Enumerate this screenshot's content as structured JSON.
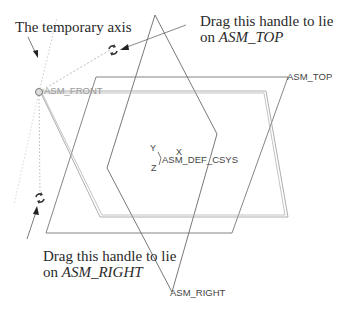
{
  "callouts": {
    "temporary_axis": "The temporary axis",
    "top_handle_line1": "Drag this handle to lie",
    "top_handle_line2_prefix": "on ",
    "top_handle_line2_ref": "ASM_TOP",
    "right_handle_line1": "Drag this handle to lie",
    "right_handle_line2_prefix": "on ",
    "right_handle_line2_ref": "ASM_RIGHT"
  },
  "planes": {
    "front": "ASM_FRONT",
    "top": "ASM_TOP",
    "right": "ASM_RIGHT"
  },
  "csys": {
    "label": "ASM_DEF_CSYS",
    "x": "X",
    "y": "Y",
    "z": "Z"
  },
  "icons": {
    "drag_handle_top": "rotate-handle-icon",
    "drag_handle_right": "rotate-handle-icon",
    "axis_origin": "circle-handle-icon"
  },
  "colors": {
    "plane_line": "#555555",
    "front_plane_line": "#8a8a8a",
    "dotted_axis": "#9a9a9a",
    "text": "#2a2a2a"
  }
}
